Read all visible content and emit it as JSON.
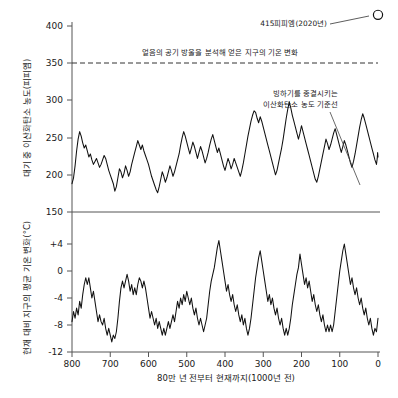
{
  "figure": {
    "background_color": "#ffffff",
    "line_color": "#111111",
    "axis_color": "#555555"
  },
  "axes": {
    "x_title": "80만 년 전부터 현재까지(1000년 전)",
    "x_ticks": [
      "800",
      "700",
      "600",
      "500",
      "400",
      "300",
      "200",
      "100",
      "0"
    ],
    "top_y_title": "대기 중 이산화탄소 농도(피피엠)",
    "top_y_ticks": [
      "400",
      "350",
      "300",
      "250",
      "200",
      "150"
    ],
    "bottom_y_title": "현재 대비 지구의 평균 기온 변화(°C)",
    "bottom_y_ticks": [
      "+4",
      "0",
      "-4",
      "-8",
      "-12"
    ]
  },
  "annotations": {
    "peak_label": "415피피엠(2020년)",
    "threshold_label": "얼음의 공기 방울을 분석해 얻은 지구의 기온 변화",
    "baseline_label_line1": "빙하기를 종결시키는",
    "baseline_label_line2": "이산화탄소 농도 기준선"
  },
  "chart_data": [
    {
      "type": "line",
      "title": "대기 중 이산화탄소 농도(피피엠)",
      "xlabel": "80만 년 전부터 현재까지(1000년 전)",
      "ylabel": "대기 중 이산화탄소 농도(피피엠)",
      "xlim": [
        800,
        0
      ],
      "ylim": [
        150,
        415
      ],
      "grid": false,
      "legend": "none",
      "reference_lines": [
        {
          "value": 350,
          "style": "dashed",
          "label": "얼음의 공기 방울을 분석해 얻은 지구의 기온 변화"
        }
      ],
      "marker_points": [
        {
          "x": 0,
          "y": 415,
          "label": "415피피엠(2020년)",
          "style": "open-circle"
        }
      ],
      "x": [
        800,
        796,
        792,
        788,
        784,
        780,
        776,
        772,
        768,
        764,
        760,
        756,
        752,
        748,
        744,
        740,
        736,
        732,
        728,
        724,
        720,
        716,
        712,
        708,
        704,
        700,
        696,
        692,
        688,
        684,
        680,
        676,
        672,
        668,
        664,
        660,
        656,
        652,
        648,
        644,
        640,
        636,
        632,
        628,
        624,
        620,
        616,
        612,
        608,
        604,
        600,
        596,
        592,
        588,
        584,
        580,
        576,
        572,
        568,
        564,
        560,
        556,
        552,
        548,
        544,
        540,
        536,
        532,
        528,
        524,
        520,
        516,
        512,
        508,
        504,
        500,
        496,
        492,
        488,
        484,
        480,
        476,
        472,
        468,
        464,
        460,
        456,
        452,
        448,
        444,
        440,
        436,
        432,
        428,
        424,
        420,
        416,
        412,
        408,
        404,
        400,
        396,
        392,
        388,
        384,
        380,
        376,
        372,
        368,
        364,
        360,
        356,
        352,
        348,
        344,
        340,
        336,
        332,
        328,
        324,
        320,
        316,
        312,
        308,
        304,
        300,
        296,
        292,
        288,
        284,
        280,
        276,
        272,
        268,
        264,
        260,
        256,
        252,
        248,
        244,
        240,
        236,
        232,
        228,
        224,
        220,
        216,
        212,
        208,
        204,
        200,
        196,
        192,
        188,
        184,
        180,
        176,
        172,
        168,
        164,
        160,
        156,
        152,
        148,
        144,
        140,
        136,
        132,
        128,
        124,
        120,
        116,
        112,
        108,
        104,
        100,
        96,
        92,
        88,
        84,
        80,
        76,
        72,
        68,
        64,
        60,
        56,
        52,
        48,
        44,
        40,
        36,
        32,
        28,
        24,
        20,
        16,
        12,
        8,
        4,
        2,
        1,
        0
      ],
      "values": [
        188,
        196,
        212,
        232,
        248,
        258,
        252,
        243,
        236,
        240,
        232,
        224,
        228,
        220,
        214,
        218,
        222,
        216,
        210,
        214,
        220,
        226,
        222,
        214,
        206,
        200,
        194,
        188,
        178,
        184,
        196,
        208,
        204,
        196,
        202,
        212,
        206,
        198,
        204,
        214,
        222,
        230,
        238,
        246,
        240,
        234,
        240,
        232,
        226,
        220,
        214,
        206,
        198,
        192,
        186,
        180,
        176,
        184,
        194,
        204,
        198,
        190,
        196,
        204,
        212,
        206,
        198,
        204,
        212,
        220,
        228,
        240,
        250,
        258,
        252,
        244,
        236,
        228,
        236,
        244,
        238,
        230,
        222,
        230,
        238,
        232,
        224,
        216,
        222,
        230,
        240,
        248,
        254,
        246,
        238,
        230,
        236,
        228,
        220,
        212,
        206,
        214,
        222,
        216,
        208,
        214,
        222,
        216,
        210,
        204,
        198,
        206,
        216,
        228,
        240,
        252,
        262,
        272,
        280,
        286,
        284,
        276,
        270,
        278,
        272,
        264,
        256,
        248,
        240,
        232,
        224,
        216,
        208,
        200,
        206,
        216,
        226,
        236,
        248,
        262,
        276,
        288,
        298,
        290,
        280,
        272,
        264,
        256,
        248,
        256,
        266,
        258,
        250,
        242,
        234,
        226,
        218,
        210,
        202,
        194,
        190,
        198,
        208,
        218,
        228,
        238,
        248,
        242,
        234,
        240,
        248,
        256,
        262,
        254,
        246,
        238,
        230,
        238,
        246,
        240,
        232,
        224,
        216,
        210,
        218,
        228,
        240,
        252,
        264,
        274,
        282,
        276,
        268,
        260,
        252,
        244,
        236,
        228,
        220,
        214,
        222,
        230,
        224,
        216,
        208,
        202,
        210,
        218,
        212,
        204,
        196,
        190,
        196,
        206,
        218,
        232,
        248,
        262,
        272,
        278,
        284,
        300,
        340,
        380,
        415
      ]
    },
    {
      "type": "line",
      "title": "현재 대비 지구의 평균 기온 변화(°C)",
      "xlabel": "80만 년 전부터 현재까지(1000년 전)",
      "ylabel": "현재 대비 지구의 평균 기온 변화(°C)",
      "xlim": [
        800,
        0
      ],
      "ylim": [
        -13,
        6
      ],
      "grid": false,
      "legend": "none",
      "x": [
        800,
        796,
        792,
        788,
        784,
        780,
        776,
        772,
        768,
        764,
        760,
        756,
        752,
        748,
        744,
        740,
        736,
        732,
        728,
        724,
        720,
        716,
        712,
        708,
        704,
        700,
        696,
        692,
        688,
        684,
        680,
        676,
        672,
        668,
        664,
        660,
        656,
        652,
        648,
        644,
        640,
        636,
        632,
        628,
        624,
        620,
        616,
        612,
        608,
        604,
        600,
        596,
        592,
        588,
        584,
        580,
        576,
        572,
        568,
        564,
        560,
        556,
        552,
        548,
        544,
        540,
        536,
        532,
        528,
        524,
        520,
        516,
        512,
        508,
        504,
        500,
        496,
        492,
        488,
        484,
        480,
        476,
        472,
        468,
        464,
        460,
        456,
        452,
        448,
        444,
        440,
        436,
        432,
        428,
        424,
        420,
        416,
        412,
        408,
        404,
        400,
        396,
        392,
        388,
        384,
        380,
        376,
        372,
        368,
        364,
        360,
        356,
        352,
        348,
        344,
        340,
        336,
        332,
        328,
        324,
        320,
        316,
        312,
        308,
        304,
        300,
        296,
        292,
        288,
        284,
        280,
        276,
        272,
        268,
        264,
        260,
        256,
        252,
        248,
        244,
        240,
        236,
        232,
        228,
        224,
        220,
        216,
        212,
        208,
        204,
        200,
        196,
        192,
        188,
        184,
        180,
        176,
        172,
        168,
        164,
        160,
        156,
        152,
        148,
        144,
        140,
        136,
        132,
        128,
        124,
        120,
        116,
        112,
        108,
        104,
        100,
        96,
        92,
        88,
        84,
        80,
        76,
        72,
        68,
        64,
        60,
        56,
        52,
        48,
        44,
        40,
        36,
        32,
        28,
        24,
        20,
        16,
        12,
        8,
        4,
        0
      ],
      "values": [
        -7.5,
        -6.0,
        -7.0,
        -5.5,
        -6.5,
        -4.5,
        -5.5,
        -3.5,
        -2.0,
        -1.0,
        -2.0,
        -1.0,
        -2.5,
        -4.0,
        -3.0,
        -4.5,
        -6.0,
        -7.5,
        -6.5,
        -7.5,
        -8.0,
        -7.0,
        -8.5,
        -9.5,
        -8.5,
        -9.5,
        -10.5,
        -9.5,
        -10.0,
        -9.0,
        -7.0,
        -4.5,
        -2.5,
        -1.5,
        -2.5,
        -1.5,
        -0.5,
        -1.5,
        -3.0,
        -2.0,
        -3.5,
        -2.5,
        -3.5,
        -2.0,
        -1.0,
        -1.5,
        -2.5,
        -1.5,
        -2.5,
        -4.0,
        -5.5,
        -7.0,
        -6.0,
        -7.0,
        -8.0,
        -7.0,
        -8.5,
        -7.5,
        -8.5,
        -9.5,
        -8.5,
        -9.5,
        -8.5,
        -7.5,
        -8.5,
        -7.5,
        -6.5,
        -7.5,
        -6.0,
        -4.5,
        -5.5,
        -4.0,
        -5.0,
        -3.5,
        -4.5,
        -3.0,
        -4.0,
        -5.0,
        -4.0,
        -5.5,
        -6.5,
        -5.5,
        -7.0,
        -8.0,
        -7.0,
        -8.0,
        -9.0,
        -8.0,
        -7.0,
        -5.0,
        -3.0,
        -1.5,
        -0.5,
        0.5,
        2.0,
        3.5,
        4.5,
        3.0,
        1.5,
        0.0,
        -1.5,
        -3.0,
        -2.0,
        -3.5,
        -4.5,
        -3.5,
        -5.0,
        -6.0,
        -5.0,
        -6.5,
        -7.5,
        -6.5,
        -8.0,
        -7.0,
        -8.5,
        -9.5,
        -8.5,
        -7.0,
        -5.0,
        -3.0,
        -1.0,
        0.5,
        2.0,
        3.0,
        1.5,
        0.0,
        -1.5,
        -3.0,
        -4.5,
        -3.5,
        -5.0,
        -4.0,
        -5.5,
        -6.5,
        -5.5,
        -7.0,
        -8.0,
        -7.0,
        -8.5,
        -9.5,
        -8.5,
        -9.5,
        -8.5,
        -7.0,
        -5.0,
        -3.5,
        -2.0,
        -0.5,
        0.5,
        2.5,
        1.0,
        -0.5,
        -2.0,
        -1.0,
        -2.5,
        -1.5,
        -3.0,
        -4.5,
        -3.5,
        -5.0,
        -6.0,
        -5.0,
        -6.5,
        -7.5,
        -6.5,
        -8.0,
        -9.0,
        -8.0,
        -9.0,
        -8.0,
        -9.0,
        -8.0,
        -6.0,
        -4.0,
        -2.0,
        0.0,
        1.5,
        3.0,
        4.0,
        2.5,
        1.0,
        -0.5,
        -2.0,
        -1.0,
        -2.5,
        -3.5,
        -2.5,
        -4.0,
        -5.0,
        -4.0,
        -5.5,
        -6.5,
        -5.5,
        -7.0,
        -8.0,
        -7.0,
        -8.5,
        -9.5,
        -8.5,
        -9.0,
        -7.0,
        -4.5,
        -2.0,
        -0.5,
        0.5,
        1.5,
        0.5,
        1.0,
        0.0
      ]
    }
  ]
}
